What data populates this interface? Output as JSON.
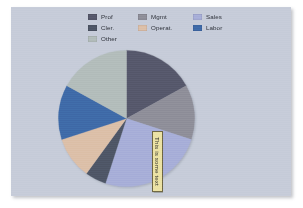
{
  "panel": {
    "background_color": "#c6ccd9"
  },
  "legend": {
    "columns": [
      {
        "items": [
          {
            "label": "Prof",
            "color": "#56586b"
          },
          {
            "label": "Cler.",
            "color": "#4e5666"
          },
          {
            "label": "Other",
            "color": "#b3bdbb"
          }
        ]
      },
      {
        "items": [
          {
            "label": "Mgmt",
            "color": "#8e8e99"
          },
          {
            "label": "Operat.",
            "color": "#dcbfa8"
          }
        ]
      },
      {
        "items": [
          {
            "label": "Sales",
            "color": "#a7aed8"
          },
          {
            "label": "Labor",
            "color": "#3f6aa8"
          }
        ]
      }
    ]
  },
  "callout": {
    "text": "This is some text",
    "fill_color": "#ece2a4",
    "border_color": "#6d6542",
    "rotation_degrees": 90
  },
  "chart_data": {
    "type": "pie",
    "title": "",
    "legend_position": "top",
    "start_angle_clock": 12,
    "direction": "clockwise",
    "categories": [
      "Prof",
      "Mgmt",
      "Sales",
      "Cler.",
      "Operat.",
      "Labor",
      "Other"
    ],
    "values": [
      17,
      13,
      25,
      5,
      10,
      13,
      17
    ],
    "colors": [
      "#56586b",
      "#8e8e99",
      "#a7aed8",
      "#4e5666",
      "#dcbfa8",
      "#3f6aa8",
      "#b3bdbb"
    ],
    "annotations": [
      {
        "text": "This is some text",
        "attached_to": "Sales",
        "rotation_degrees": 90
      }
    ]
  }
}
